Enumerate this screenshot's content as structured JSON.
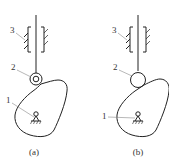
{
  "diagram": {
    "type": "cam-follower mechanism comparison",
    "colors": {
      "stroke": "#222222",
      "label": "#333333",
      "background": "#ffffff"
    },
    "panels": [
      {
        "id": "a",
        "caption": "(a)",
        "follower_type": "roller follower (roller with pin)",
        "labels": {
          "part1": "1",
          "part2": "2",
          "part3": "3"
        }
      },
      {
        "id": "b",
        "caption": "(b)",
        "follower_type": "roller follower (solid roller)",
        "labels": {
          "part1": "1",
          "part2": "2",
          "part3": "3"
        }
      }
    ],
    "parts": {
      "1": "cam",
      "2": "roller",
      "3": "guide"
    }
  }
}
